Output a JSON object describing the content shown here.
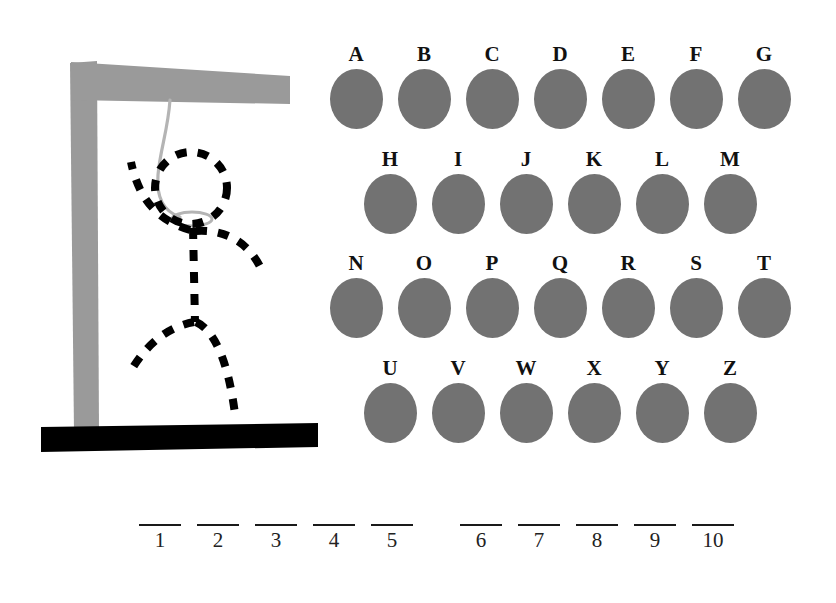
{
  "canvas": {
    "width": 836,
    "height": 603,
    "background": "#ffffff"
  },
  "game": {
    "title": "Hangman",
    "gallows": {
      "post_color": "#9a9a9a",
      "beam_color": "#9a9a9a",
      "base_color": "#000000",
      "rope_color": "#b4b4b4",
      "figure_color": "#000000",
      "figure_parts": [
        "head",
        "torso",
        "left-arm",
        "right-arm",
        "left-leg",
        "right-leg"
      ],
      "figure_style": "dashed"
    },
    "letters": {
      "blob_color": "#727272",
      "label_color": "#111111",
      "rows": [
        {
          "indent": 0,
          "items": [
            "A",
            "B",
            "C",
            "D",
            "E",
            "F",
            "G"
          ]
        },
        {
          "indent": 34,
          "items": [
            "H",
            "I",
            "J",
            "K",
            "L",
            "M"
          ]
        },
        {
          "indent": 0,
          "items": [
            "N",
            "O",
            "P",
            "Q",
            "R",
            "S",
            "T"
          ]
        },
        {
          "indent": 34,
          "items": [
            "U",
            "V",
            "W",
            "X",
            "Y",
            "Z"
          ]
        }
      ]
    },
    "answer": {
      "line_color": "#1a1a1a",
      "number_color": "#222222",
      "groups": [
        {
          "name": "left-word",
          "numbers": [
            "1",
            "2",
            "3",
            "4",
            "5"
          ]
        },
        {
          "name": "right-word",
          "numbers": [
            "6",
            "7",
            "8",
            "9",
            "10"
          ]
        }
      ]
    }
  }
}
